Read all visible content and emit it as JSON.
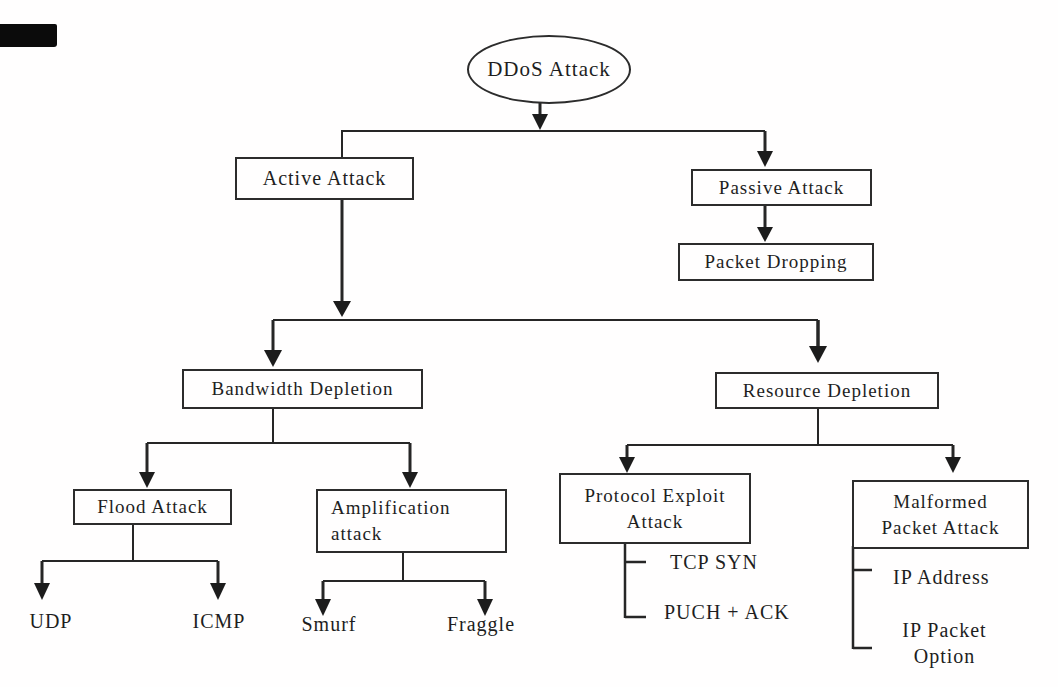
{
  "colors": {
    "ink": "#262626",
    "text": "#1e1e1e",
    "background": "#ffffff",
    "artifact_bar": "#0b0b0b"
  },
  "nodes": {
    "ddos": {
      "label": "DDoS Attack"
    },
    "active": {
      "label": "Active Attack"
    },
    "passive": {
      "label": "Passive Attack"
    },
    "packet_dropping": {
      "label": "Packet Dropping"
    },
    "bandwidth": {
      "label": "Bandwidth Depletion"
    },
    "resource": {
      "label": "Resource Depletion"
    },
    "flood": {
      "label": "Flood Attack"
    },
    "amplification": {
      "line1": "Amplification",
      "line2": "attack"
    },
    "protocol": {
      "line1": "Protocol Exploit",
      "line2": "Attack"
    },
    "malformed": {
      "line1": "Malformed",
      "line2": "Packet Attack"
    },
    "udp": {
      "label": "UDP"
    },
    "icmp": {
      "label": "ICMP"
    },
    "smurf": {
      "label": "Smurf"
    },
    "fraggle": {
      "label": "Fraggle"
    },
    "tcp_syn": {
      "label": "TCP SYN"
    },
    "puch_ack": {
      "label": "PUCH + ACK"
    },
    "ip_address": {
      "label": "IP Address"
    },
    "ip_packet_option": {
      "line1": "IP Packet",
      "line2": "Option"
    }
  },
  "edges": [
    [
      "DDoS Attack",
      "Active Attack"
    ],
    [
      "DDoS Attack",
      "Passive Attack"
    ],
    [
      "Passive Attack",
      "Packet Dropping"
    ],
    [
      "Active Attack",
      "Bandwidth Depletion"
    ],
    [
      "Active Attack",
      "Resource Depletion"
    ],
    [
      "Bandwidth Depletion",
      "Flood Attack"
    ],
    [
      "Bandwidth Depletion",
      "Amplification attack"
    ],
    [
      "Flood Attack",
      "UDP"
    ],
    [
      "Flood Attack",
      "ICMP"
    ],
    [
      "Amplification attack",
      "Smurf"
    ],
    [
      "Amplification attack",
      "Fraggle"
    ],
    [
      "Resource Depletion",
      "Protocol Exploit Attack"
    ],
    [
      "Resource Depletion",
      "Malformed Packet Attack"
    ],
    [
      "Protocol Exploit Attack",
      "TCP SYN"
    ],
    [
      "Protocol Exploit Attack",
      "PUCH + ACK"
    ],
    [
      "Malformed Packet Attack",
      "IP Address"
    ],
    [
      "Malformed Packet Attack",
      "IP Packet Option"
    ]
  ]
}
